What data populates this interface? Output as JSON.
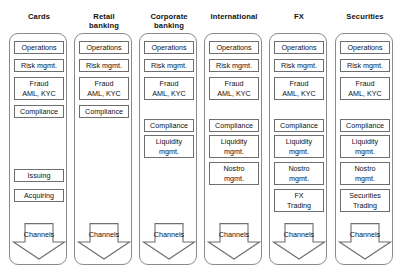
{
  "diagram": {
    "title_lines_separator": "\n",
    "columns": [
      {
        "id": "cards",
        "title": "Cards",
        "boxes": [
          {
            "label": "Operations",
            "lines": 1,
            "top": 40
          },
          {
            "label": "Risk mgmt.",
            "lines": 1,
            "top": 58
          },
          {
            "label": "Fraud\nAML, KYC",
            "lines": 2,
            "top": 76
          },
          {
            "label": "Compliance",
            "lines": 1,
            "top": 104
          },
          {
            "label": "Issuing",
            "lines": 1,
            "top": 168
          },
          {
            "label": "Acquiring",
            "lines": 1,
            "top": 188
          }
        ],
        "arrow": {
          "label": "Channels",
          "top": 222
        }
      },
      {
        "id": "retail-banking",
        "title": "Retail\nbanking",
        "boxes": [
          {
            "label": "Operations",
            "lines": 1,
            "top": 40
          },
          {
            "label": "Risk mgmt.",
            "lines": 1,
            "top": 58
          },
          {
            "label": "Fraud\nAML, KYC",
            "lines": 2,
            "top": 76
          },
          {
            "label": "Compliance",
            "lines": 1,
            "top": 104
          }
        ],
        "arrow": {
          "label": "Channels",
          "top": 222
        }
      },
      {
        "id": "corporate-banking",
        "title": "Corporate\nbanking",
        "boxes": [
          {
            "label": "Operations",
            "lines": 1,
            "top": 40
          },
          {
            "label": "Risk mgmt.",
            "lines": 1,
            "top": 58
          },
          {
            "label": "Fraud\nAML, KYC",
            "lines": 2,
            "top": 76
          },
          {
            "label": "Compliance",
            "lines": 1,
            "top": 118
          },
          {
            "label": "Liquidity\nmgmt.",
            "lines": 2,
            "top": 134
          }
        ],
        "arrow": {
          "label": "Channels",
          "top": 222
        }
      },
      {
        "id": "international",
        "title": "International",
        "boxes": [
          {
            "label": "Operations",
            "lines": 1,
            "top": 40
          },
          {
            "label": "Risk mgmt.",
            "lines": 1,
            "top": 58
          },
          {
            "label": "Fraud\nAML, KYC",
            "lines": 2,
            "top": 76
          },
          {
            "label": "Compliance",
            "lines": 1,
            "top": 118
          },
          {
            "label": "Liquidity\nmgmt.",
            "lines": 2,
            "top": 134
          },
          {
            "label": "Nostro\nmgmt.",
            "lines": 2,
            "top": 161
          }
        ],
        "arrow": {
          "label": "Channels",
          "top": 222
        }
      },
      {
        "id": "fx",
        "title": "FX",
        "boxes": [
          {
            "label": "Operations",
            "lines": 1,
            "top": 40
          },
          {
            "label": "Risk mgmt.",
            "lines": 1,
            "top": 58
          },
          {
            "label": "Fraud\nAML, KYC",
            "lines": 2,
            "top": 76
          },
          {
            "label": "Compliance",
            "lines": 1,
            "top": 118
          },
          {
            "label": "Liquidity\nmgmt.",
            "lines": 2,
            "top": 134
          },
          {
            "label": "Nostro\nmgmt.",
            "lines": 2,
            "top": 161
          },
          {
            "label": "FX\nTrading",
            "lines": 2,
            "top": 188
          }
        ],
        "arrow": {
          "label": "Channels",
          "top": 222
        }
      },
      {
        "id": "securities",
        "title": "Securities",
        "boxes": [
          {
            "label": "Operations",
            "lines": 1,
            "top": 40
          },
          {
            "label": "Risk mgmt.",
            "lines": 1,
            "top": 58
          },
          {
            "label": "Fraud\nAML, KYC",
            "lines": 2,
            "top": 76
          },
          {
            "label": "Compliance",
            "lines": 1,
            "top": 118
          },
          {
            "label": "Liquidity\nmgmt.",
            "lines": 2,
            "top": 134
          },
          {
            "label": "Nostro\nmgmt.",
            "lines": 2,
            "top": 161
          },
          {
            "label": "Securities\nTrading",
            "lines": 2,
            "top": 188
          }
        ],
        "arrow": {
          "label": "Channels",
          "top": 222
        }
      }
    ],
    "layout": {
      "column_left_positions": [
        9,
        74,
        139,
        204,
        269,
        335
      ],
      "colors": {
        "box_border": "#6e6e6e",
        "pillar_border": "#8a8a8a",
        "text": "#111111",
        "background": "#ffffff"
      }
    }
  }
}
